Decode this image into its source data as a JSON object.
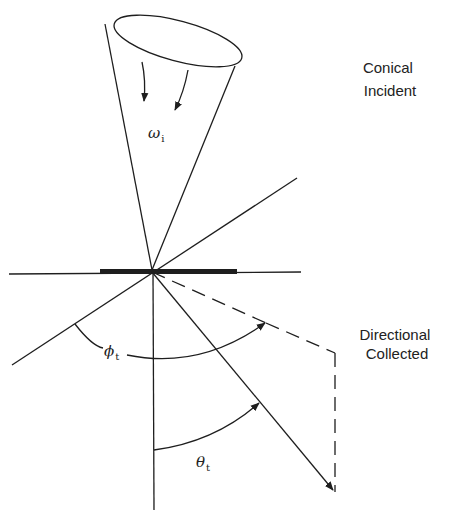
{
  "diagram": {
    "labels": {
      "conical_incident": [
        "Conical",
        "Incident"
      ],
      "directional_collected": [
        "Directional",
        "Collected"
      ],
      "omega": "ω",
      "omega_sub": "i",
      "phi": "ϕ",
      "phi_sub": "t",
      "theta": "θ",
      "theta_sub": "t"
    },
    "colors": {
      "line": "#1e1e1e",
      "background": "#ffffff"
    }
  }
}
